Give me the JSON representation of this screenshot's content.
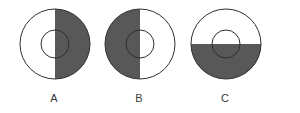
{
  "figure": {
    "background_color": "#ffffff",
    "shading_color": "#585858",
    "unshaded_color": "#ffffff",
    "outline_color": "#2f2f2f",
    "label_color": "#3a3a3a",
    "outer_diameter_px": 70,
    "inner_diameter_px": 28,
    "items": [
      {
        "label": "A",
        "name": "circle-a",
        "shaded_region": "right-half",
        "split_orientation": "vertical",
        "shaded_fraction": 0.5,
        "center_x": 54,
        "center_y": 49,
        "inner_circle": "outline-only"
      },
      {
        "label": "B",
        "name": "circle-b",
        "shaded_region": "left-half",
        "split_orientation": "vertical",
        "shaded_fraction": 0.5,
        "center_x": 139,
        "center_y": 49,
        "inner_circle": "outline-only"
      },
      {
        "label": "C",
        "name": "circle-c",
        "shaded_region": "bottom-half",
        "split_orientation": "horizontal",
        "shaded_fraction": 0.5,
        "center_x": 225,
        "center_y": 49,
        "inner_circle": "outline-only"
      }
    ]
  }
}
